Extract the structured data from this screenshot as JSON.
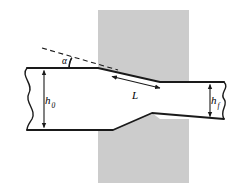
{
  "figure": {
    "background_color": "#ffffff",
    "width": 251,
    "height": 193
  },
  "colors": {
    "outline": "#1a1a1a",
    "die_fill": "#cccccc",
    "workpiece_fill": "#ffffff",
    "dimension_line": "#1a1a1a",
    "dashed_line": "#1a1a1a"
  },
  "labels": {
    "initial_thickness": {
      "symbol": "h",
      "subscript": "0",
      "name": "initial thickness"
    },
    "final_thickness": {
      "symbol": "h",
      "subscript": "f",
      "name": "final thickness"
    },
    "contact_length": {
      "symbol": "L",
      "subscript": "",
      "name": "contact length"
    },
    "die_angle": {
      "symbol": "α",
      "subscript": "",
      "name": "die angle"
    }
  },
  "geometry": {
    "die": {
      "name": "die-block",
      "x": 98,
      "y": 10,
      "width": 91,
      "height": 173,
      "fill": "#cccccc"
    },
    "workpiece_outline": "M 27,68 L 98,68 L 160,82 L 193,82 L 224,82 L 224,119 L 193,119 L 160,119 L 152,113 L 113,130 L 27,130 Z",
    "workpiece_top_entry_y": 68,
    "workpiece_bottom_entry_y": 130,
    "workpiece_top_exit_y": 82,
    "workpiece_bottom_exit_y": 119,
    "taper_start_x": 98,
    "taper_end_x": 160,
    "dashed_extension": {
      "x1": 42,
      "y1": 48,
      "x2": 118,
      "y2": 70
    },
    "angle_arc": {
      "center_x": 89,
      "center_y": 68,
      "radius": 20,
      "start_deg": 180,
      "sweep_deg": 16
    }
  },
  "dimensions": [
    {
      "name": "h0-dimension",
      "label_key": "initial_thickness",
      "x": 44,
      "y_top": 68,
      "y_bottom": 130,
      "label_x": 47,
      "label_y": 103
    },
    {
      "name": "hf-dimension",
      "label_key": "final_thickness",
      "x": 210,
      "y_top": 82,
      "y_bottom": 119,
      "label_x": 213,
      "label_y": 104
    },
    {
      "name": "L-dimension",
      "label_key": "contact_length",
      "x1": 111,
      "y1": 76,
      "x2": 161,
      "y2": 88,
      "label_x": 134,
      "label_y": 95
    }
  ]
}
